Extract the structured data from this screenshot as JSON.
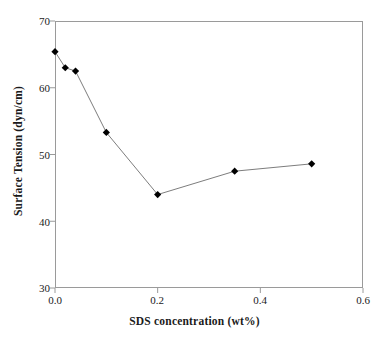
{
  "chart_data": {
    "type": "line",
    "title": "",
    "xlabel": "SDS concentration (wt%)",
    "ylabel": "Surface Tension (dyn/cm)",
    "xlim": [
      0.0,
      0.6
    ],
    "ylim": [
      30,
      70
    ],
    "xticks": [
      "0.0",
      "0.2",
      "0.4",
      "0.6"
    ],
    "xtick_values": [
      0.0,
      0.2,
      0.4,
      0.6
    ],
    "yticks": [
      "30",
      "40",
      "50",
      "60",
      "70"
    ],
    "ytick_values": [
      30,
      40,
      50,
      60,
      70
    ],
    "grid": false,
    "legend": "none",
    "marker": "diamond",
    "marker_color": "#000000",
    "line_color": "#7d7d7d",
    "frame_color": "#9a9a9a",
    "series": [
      {
        "name": "Surface Tension",
        "x": [
          0.0,
          0.02,
          0.04,
          0.1,
          0.2,
          0.35,
          0.5
        ],
        "values": [
          65.4,
          63.0,
          62.5,
          53.3,
          44.0,
          47.5,
          48.6
        ]
      }
    ]
  }
}
